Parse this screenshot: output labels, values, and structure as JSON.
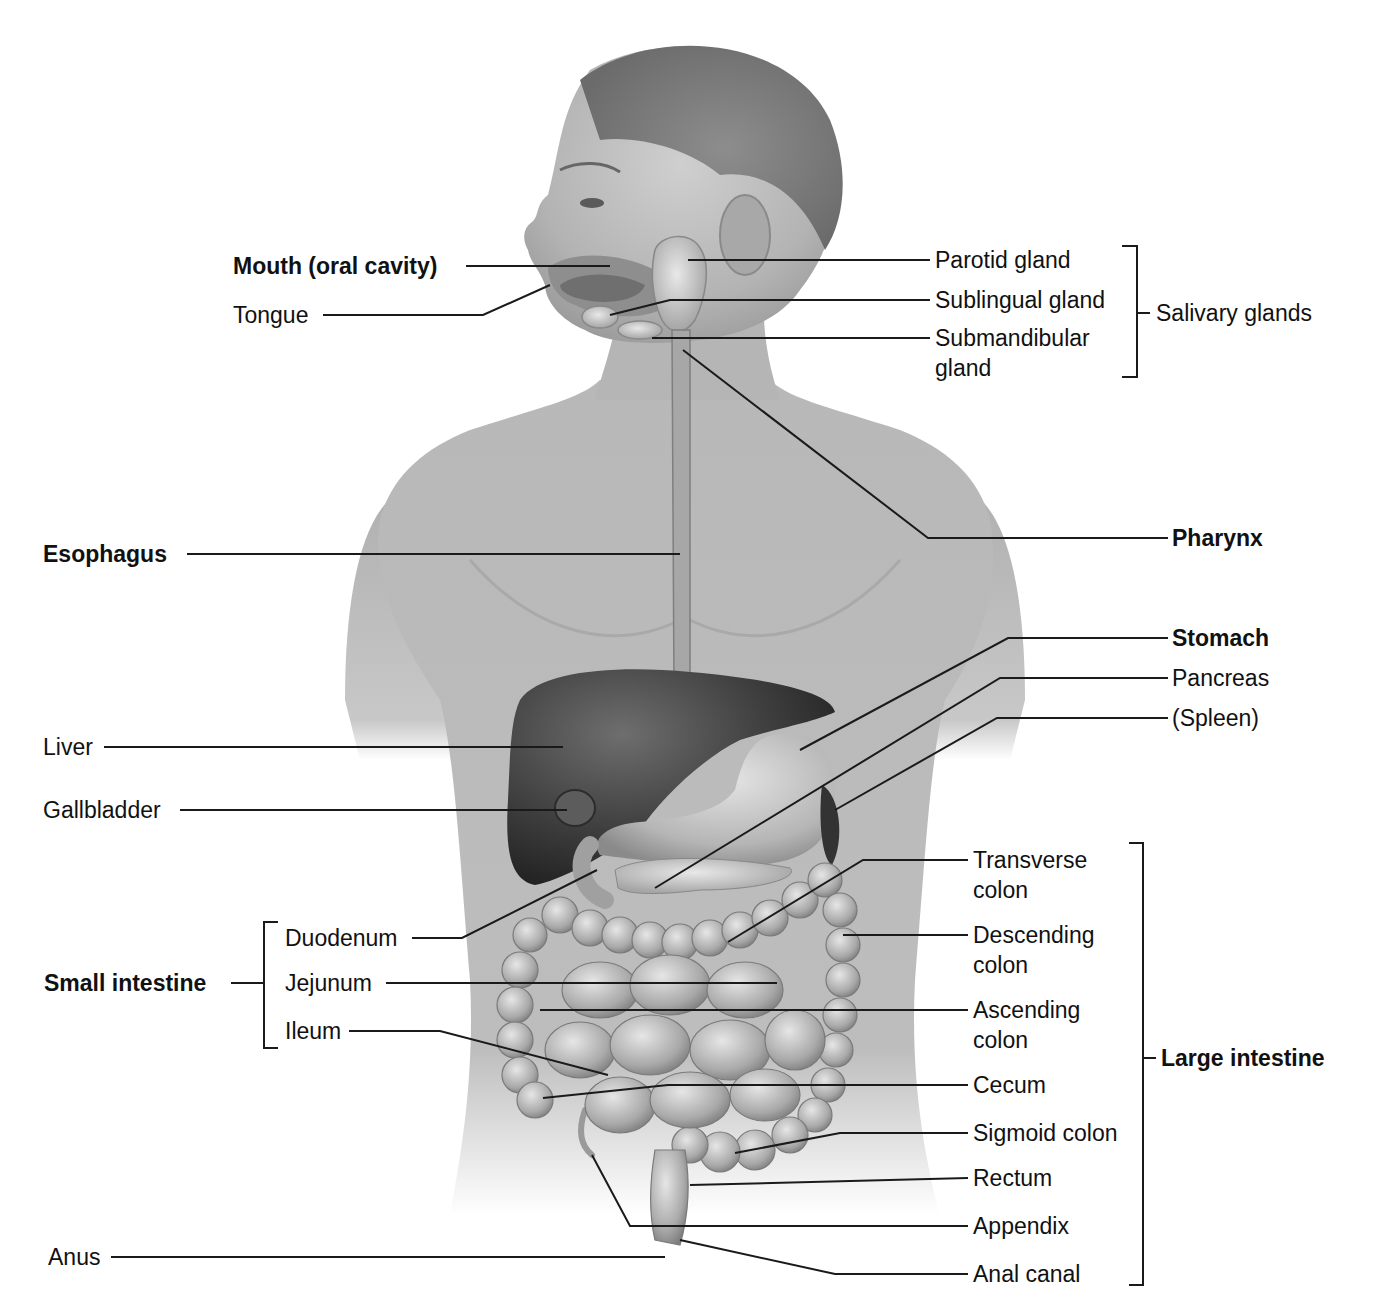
{
  "diagram": {
    "type": "anatomical-illustration",
    "style": "grayscale shaded illustration, head in left-facing profile, torso anterior view",
    "colors": {
      "background": "#ffffff",
      "text": "#111111",
      "leader_line": "#1a1a1a",
      "skin": "#bdbdbd",
      "organ_dark": "#3a3a3a",
      "organ_light": "#d2d2d2"
    }
  },
  "labels": {
    "mouth": "Mouth (oral cavity)",
    "tongue": "Tongue",
    "parotid": "Parotid gland",
    "sublingual": "Sublingual gland",
    "submandibular": "Submandibular gland",
    "salivary_group": "Salivary glands",
    "esophagus": "Esophagus",
    "pharynx": "Pharynx",
    "stomach": "Stomach",
    "pancreas": "Pancreas",
    "spleen": "(Spleen)",
    "liver": "Liver",
    "gallbladder": "Gallbladder",
    "small_intestine_group": "Small intestine",
    "duodenum": "Duodenum",
    "jejunum": "Jejunum",
    "ileum": "Ileum",
    "transverse_colon": "Transverse colon",
    "descending_colon": "Descending colon",
    "ascending_colon": "Ascending colon",
    "cecum": "Cecum",
    "sigmoid_colon": "Sigmoid colon",
    "rectum": "Rectum",
    "appendix": "Appendix",
    "anal_canal": "Anal canal",
    "large_intestine_group": "Large intestine",
    "anus": "Anus"
  },
  "groups": [
    {
      "name": "Salivary glands",
      "members": [
        "Parotid gland",
        "Sublingual gland",
        "Submandibular gland"
      ]
    },
    {
      "name": "Small intestine",
      "members": [
        "Duodenum",
        "Jejunum",
        "Ileum"
      ]
    },
    {
      "name": "Large intestine",
      "members": [
        "Transverse colon",
        "Descending colon",
        "Ascending colon",
        "Cecum",
        "Sigmoid colon",
        "Rectum",
        "Appendix",
        "Anal canal"
      ]
    }
  ],
  "bold_labels": [
    "Mouth (oral cavity)",
    "Esophagus",
    "Pharynx",
    "Stomach",
    "Small intestine",
    "Large intestine"
  ]
}
